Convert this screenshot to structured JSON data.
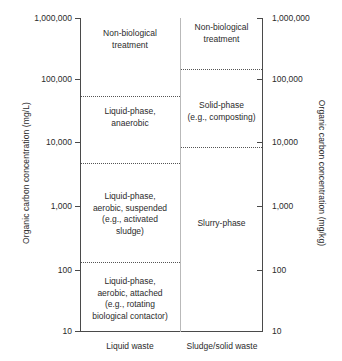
{
  "chart_data": {
    "type": "table",
    "title": "",
    "ylabel_left": "Organic carbon concentration (mg/L)",
    "ylabel_right": "Organic carbon concentration (mg/kg)",
    "xlabel": "",
    "yscale": "log",
    "ylim": [
      10,
      1000000
    ],
    "ytick_labels": [
      "1,000,000",
      "100,000",
      "10,000",
      "1,000",
      "100",
      "10"
    ],
    "ytick_values": [
      1000000,
      100000,
      10000,
      1000,
      100,
      10
    ],
    "grid": false,
    "legend": "none",
    "categories": [
      "Liquid waste",
      "Sludge/solid waste"
    ],
    "series": [
      {
        "name": "Liquid waste",
        "regions": [
          {
            "label": "Non-biological\ntreatment",
            "min": 60000,
            "max": 1000000
          },
          {
            "label": "Liquid-phase,\nanaerobic",
            "min": 5000,
            "max": 60000
          },
          {
            "label": "Liquid-phase,\naerobic, suspended\n(e.g., activated\nsludge)",
            "min": 130,
            "max": 5000
          },
          {
            "label": "Liquid-phase,\naerobic, attached\n(e.g., rotating\nbiological contactor)",
            "min": 10,
            "max": 130
          }
        ]
      },
      {
        "name": "Sludge/solid waste",
        "regions": [
          {
            "label": "Non-biological\ntreatment",
            "min": 160000,
            "max": 1000000
          },
          {
            "label": "Solid-phase\n(e.g., composting)",
            "min": 9000,
            "max": 160000
          },
          {
            "label": "Slurry-phase",
            "min": 10,
            "max": 9000
          }
        ]
      }
    ]
  },
  "axes": {
    "left_title": "Organic carbon concentration (mg/L)",
    "right_title": "Organic carbon concentration (mg/kg)",
    "ticks": [
      {
        "label": "1,000,000",
        "y": 0
      },
      {
        "label": "100,000",
        "y": 61
      },
      {
        "label": "10,000",
        "y": 124
      },
      {
        "label": "1,000",
        "y": 188
      },
      {
        "label": "100",
        "y": 252
      },
      {
        "label": "10",
        "y": 313
      }
    ]
  },
  "columns": {
    "left": {
      "label": "Liquid waste",
      "regions": [
        {
          "text": "Non-biological\ntreatment",
          "top": 10,
          "height": 68
        },
        {
          "text": "Liquid-phase,\nanaerobic",
          "top": 88,
          "height": 52
        },
        {
          "text": "Liquid-phase,\naerobic, suspended\n(e.g., activated\nsludge)",
          "top": 173,
          "height": 50
        },
        {
          "text": "Liquid-phase,\naerobic, attached\n(e.g., rotating\nbiological contactor)",
          "top": 258,
          "height": 50
        }
      ],
      "boundaries": [
        78,
        145,
        244
      ]
    },
    "right": {
      "label": "Sludge/solid waste",
      "regions": [
        {
          "text": "Non-biological\ntreatment",
          "top": 4,
          "height": 30
        },
        {
          "text": "Solid-phase\n(e.g., composting)",
          "top": 82,
          "height": 30
        },
        {
          "text": "Slurry-phase",
          "top": 200,
          "height": 14
        }
      ],
      "boundaries": [
        51,
        129
      ]
    }
  },
  "colors": {
    "axis": "#4a4a4a",
    "divider": "#b9b9b9",
    "text": "#2b2b2b",
    "dotted": "#555555",
    "background": "#ffffff"
  }
}
